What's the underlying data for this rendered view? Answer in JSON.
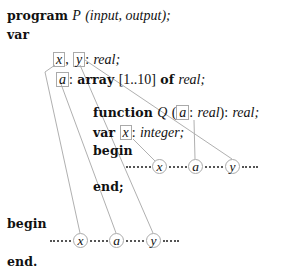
{
  "program_header": {
    "keyword": "program",
    "name": "P",
    "params": "(input, output);"
  },
  "outer_var": {
    "keyword": "var",
    "decl1": {
      "var1": "x",
      "sep": ",",
      "var2": "y",
      "type_sep": ":",
      "type": "real;"
    },
    "decl2": {
      "var1": "a",
      "type_sep": ":",
      "array_kw": "array",
      "range": "[1..10]",
      "of_kw": "of",
      "type": "real;"
    }
  },
  "function_decl": {
    "keyword": "function",
    "name": "Q",
    "open": "(",
    "param": "a",
    "param_sep": ":",
    "param_type": "real",
    "close": "):",
    "return_type": "real;"
  },
  "inner_var": {
    "keyword": "var",
    "var1": "x",
    "type_sep": ":",
    "type": "integer;"
  },
  "inner_body": {
    "begin": "begin",
    "refs": [
      "x",
      "a",
      "y"
    ],
    "end": "end;"
  },
  "outer_body": {
    "begin": "begin",
    "refs": [
      "x",
      "a",
      "y"
    ],
    "end": "end."
  },
  "link_color": "#aaaaaa"
}
